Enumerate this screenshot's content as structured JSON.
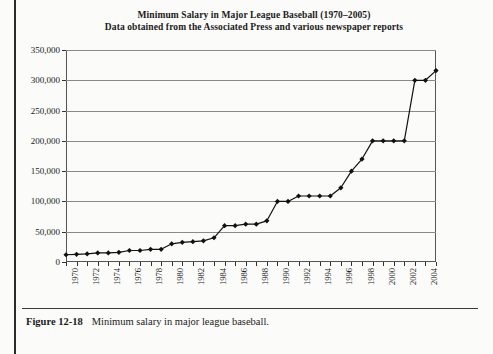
{
  "figure": {
    "caption_label": "Figure 12-18",
    "caption_text": "Minimum salary in major league baseball."
  },
  "chart_data": {
    "type": "line",
    "title": "Minimum Salary in Major League Baseball (1970–2005)",
    "subtitle": "Data obtained from the Associated Press and various newspaper reports",
    "xlabel": "",
    "ylabel": "",
    "xlim": [
      1970,
      2005
    ],
    "ylim": [
      0,
      350000
    ],
    "grid": true,
    "legend": "none",
    "marker": "filled-diamond",
    "y_ticks": [
      0,
      50000,
      100000,
      150000,
      200000,
      250000,
      300000,
      350000
    ],
    "y_tick_labels": [
      "0",
      "50,000",
      "100,000",
      "150,000",
      "200,000",
      "250,000",
      "300,000",
      "350,000"
    ],
    "x_ticks": [
      1970,
      1972,
      1974,
      1976,
      1978,
      1980,
      1982,
      1984,
      1986,
      1988,
      1990,
      1992,
      1994,
      1996,
      1998,
      2000,
      2002,
      2004
    ],
    "x_tick_labels": [
      "1970",
      "1972",
      "1974",
      "1976",
      "1978",
      "1980",
      "1982",
      "1984",
      "1986",
      "1988",
      "1990",
      "1992",
      "1994",
      "1996",
      "1998",
      "2000",
      "2002",
      "2004"
    ],
    "x": [
      1970,
      1971,
      1972,
      1973,
      1974,
      1975,
      1976,
      1977,
      1978,
      1979,
      1980,
      1981,
      1982,
      1983,
      1984,
      1985,
      1986,
      1987,
      1988,
      1989,
      1990,
      1991,
      1992,
      1993,
      1994,
      1995,
      1996,
      1997,
      1998,
      1999,
      2000,
      2001,
      2002,
      2003,
      2004,
      2005
    ],
    "values": [
      12000,
      12750,
      13500,
      15000,
      15000,
      16000,
      19000,
      19000,
      21000,
      21000,
      30000,
      32500,
      33500,
      35000,
      40000,
      60000,
      60000,
      62500,
      62500,
      68000,
      100000,
      100000,
      109000,
      109000,
      109000,
      109000,
      122500,
      150000,
      170000,
      200000,
      200000,
      200000,
      200000,
      300000,
      300000,
      316000
    ],
    "series_name": "Minimum salary (US$)",
    "colors": {
      "line": "#111111",
      "marker": "#111111",
      "grid": "#8a8a8a",
      "frame": "#555555"
    }
  }
}
